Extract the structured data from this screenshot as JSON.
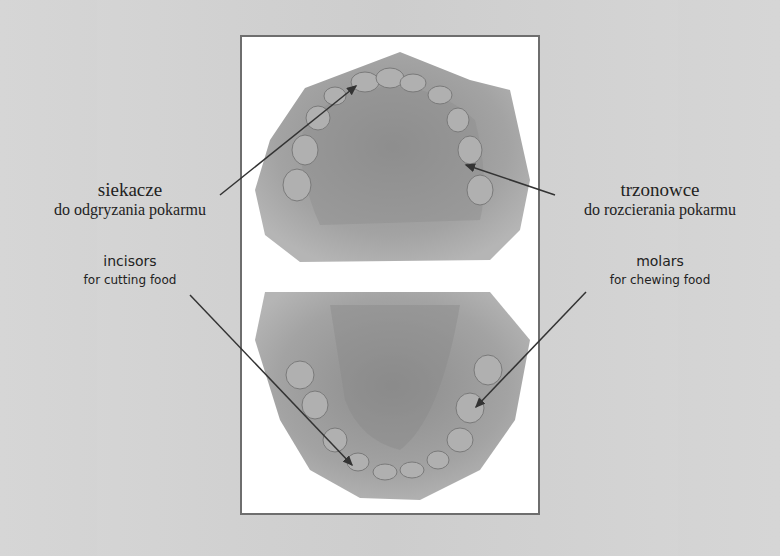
{
  "diagram": {
    "labels": {
      "left_pl": {
        "title": "siekacze",
        "subtitle": "do odgryzania pokarmu"
      },
      "right_pl": {
        "title": "trzonowce",
        "subtitle": "do rozcierania pokarmu"
      },
      "left_en": {
        "title": "incisors",
        "subtitle": "for cutting food"
      },
      "right_en": {
        "title": "molars",
        "subtitle": "for chewing food"
      }
    },
    "colors": {
      "background": "#d4d4d4",
      "frame_border": "#6e6e6e",
      "cast": "#9a9a9a",
      "arrow": "#333333"
    }
  }
}
